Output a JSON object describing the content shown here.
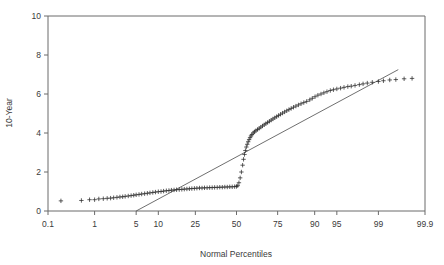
{
  "chart_data": {
    "type": "scatter",
    "title": "",
    "subtitle": "",
    "xlabel": "Normal Percentiles",
    "ylabel": "10-Year",
    "grid": false,
    "legend": "none",
    "x_scale": "normal-probability",
    "x_tick_labels": [
      "0.1",
      "1",
      "5",
      "10",
      "25",
      "50",
      "75",
      "90",
      "95",
      "99",
      "99.9"
    ],
    "x_tick_values": [
      0.1,
      1,
      5,
      10,
      25,
      50,
      75,
      90,
      95,
      99,
      99.9
    ],
    "xlim": [
      0.1,
      99.9
    ],
    "y_tick_labels": [
      "0",
      "2",
      "4",
      "6",
      "8",
      "10"
    ],
    "y_tick_values": [
      0,
      2,
      4,
      6,
      8,
      10
    ],
    "ylim": [
      0,
      10
    ],
    "marker": "+",
    "marker_color": "#2a2a2a",
    "series": [
      {
        "name": "10-Year sample quantiles",
        "marker": "plus",
        "x": [
          0.2,
          0.55,
          0.8,
          1.0,
          1.2,
          1.45,
          1.7,
          1.95,
          2.2,
          2.5,
          2.8,
          3.1,
          3.4,
          3.8,
          4.2,
          4.6,
          5.0,
          5.5,
          6.0,
          6.6,
          7.2,
          7.8,
          8.5,
          9.2,
          10.0,
          10.8,
          11.6,
          12.5,
          13.4,
          14.3,
          15.3,
          16.3,
          17.4,
          18.5,
          19.6,
          20.8,
          22.0,
          23.2,
          24.5,
          25.8,
          27.2,
          28.6,
          30.0,
          31.5,
          33.0,
          34.5,
          36.0,
          37.6,
          39.2,
          40.8,
          42.4,
          44.0,
          45.6,
          47.2,
          48.8,
          50.0,
          50.8,
          51.6,
          52.4,
          53.2,
          54.0,
          54.6,
          55.2,
          55.8,
          56.4,
          57.0,
          57.6,
          58.2,
          58.8,
          59.4,
          60.0,
          60.8,
          61.6,
          62.5,
          63.5,
          64.5,
          65.5,
          66.5,
          67.5,
          68.5,
          69.5,
          70.5,
          71.5,
          72.5,
          73.5,
          74.5,
          75.5,
          76.5,
          77.5,
          78.5,
          79.5,
          80.5,
          81.5,
          82.5,
          83.5,
          84.5,
          85.5,
          86.5,
          87.5,
          88.5,
          89.3,
          90.1,
          90.9,
          91.7,
          92.4,
          93.1,
          93.8,
          94.4,
          95.0,
          95.6,
          96.1,
          96.6,
          97.0,
          97.4,
          97.8,
          98.1,
          98.4,
          98.7,
          99.0,
          99.2,
          99.4,
          99.55,
          99.7,
          99.8
        ],
        "y": [
          0.52,
          0.54,
          0.58,
          0.58,
          0.62,
          0.63,
          0.65,
          0.66,
          0.68,
          0.7,
          0.72,
          0.73,
          0.75,
          0.77,
          0.79,
          0.81,
          0.83,
          0.85,
          0.87,
          0.89,
          0.91,
          0.93,
          0.95,
          0.97,
          0.99,
          1.0,
          1.02,
          1.04,
          1.05,
          1.07,
          1.08,
          1.09,
          1.1,
          1.11,
          1.12,
          1.13,
          1.14,
          1.15,
          1.16,
          1.17,
          1.18,
          1.18,
          1.19,
          1.19,
          1.2,
          1.2,
          1.21,
          1.21,
          1.22,
          1.22,
          1.23,
          1.23,
          1.24,
          1.24,
          1.25,
          1.26,
          1.3,
          1.45,
          1.7,
          2.0,
          2.35,
          2.65,
          2.9,
          3.1,
          3.28,
          3.42,
          3.55,
          3.66,
          3.76,
          3.85,
          3.92,
          4.0,
          4.06,
          4.12,
          4.18,
          4.24,
          4.3,
          4.36,
          4.42,
          4.48,
          4.54,
          4.6,
          4.66,
          4.72,
          4.78,
          4.84,
          4.9,
          4.96,
          5.02,
          5.08,
          5.14,
          5.2,
          5.26,
          5.32,
          5.38,
          5.44,
          5.5,
          5.56,
          5.62,
          5.7,
          5.78,
          5.86,
          5.94,
          6.0,
          6.06,
          6.12,
          6.18,
          6.22,
          6.26,
          6.3,
          6.34,
          6.38,
          6.4,
          6.44,
          6.48,
          6.52,
          6.56,
          6.6,
          6.64,
          6.68,
          6.72,
          6.74,
          6.78,
          6.8
        ]
      }
    ],
    "reference_line": {
      "name": "normal reference line",
      "x_start": 5.0,
      "y_start": 0.0,
      "x_end": 99.6,
      "y_end": 7.25
    },
    "annotations": []
  }
}
